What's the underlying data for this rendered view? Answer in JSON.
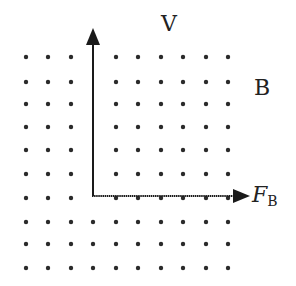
{
  "diagram": {
    "labels": {
      "velocity": "V",
      "field": "B",
      "force_main": "F",
      "force_sub": "B"
    },
    "field": {
      "symbol": "dot",
      "direction": "out of page",
      "columns_x": [
        26,
        48,
        71,
        93,
        116,
        138,
        161,
        183,
        206,
        228
      ],
      "rows_y": [
        57,
        82,
        104,
        127,
        150,
        174,
        198,
        222,
        244,
        268
      ],
      "gap_column_x": 93,
      "gap_rows_upto_y": 198
    },
    "vectors": [
      {
        "name": "velocity",
        "from": [
          93,
          196
        ],
        "to": [
          93,
          29
        ],
        "direction": "up"
      },
      {
        "name": "magnetic-force",
        "from": [
          93,
          196
        ],
        "to": [
          249,
          196
        ],
        "direction": "right"
      }
    ],
    "colors": {
      "ink": "#1a1a1a",
      "dot": "#2a2a2a",
      "background": "#ffffff"
    }
  }
}
